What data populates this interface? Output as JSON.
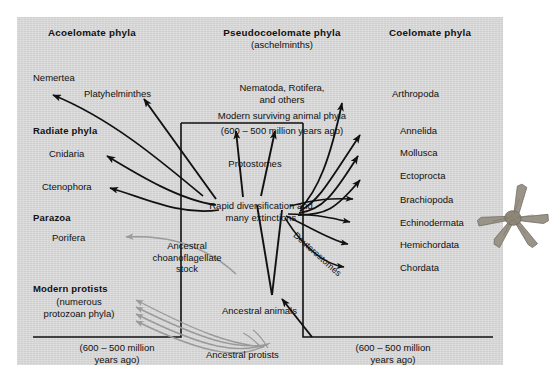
{
  "figure": {
    "panel_color": "#d6d6d6",
    "ink_color": "#111111",
    "faded_arrow_color": "#8f8f8f"
  },
  "headers": [
    {
      "id": "acoelomate",
      "label": "Acoelomate phyla",
      "sub": ""
    },
    {
      "id": "pseudocoelomate",
      "label": "Pseudocoelomate phyla",
      "sub": "(aschelminths)"
    },
    {
      "id": "coelomate",
      "label": "Coelomate phyla",
      "sub": ""
    }
  ],
  "left_groups": [
    {
      "id": "nemertea",
      "label": "Nemertea",
      "bold": false
    },
    {
      "id": "platyhelminthes",
      "label": "Platyhelminthes",
      "bold": false
    },
    {
      "id": "radiate-phyla",
      "label": "Radiate phyla",
      "bold": true
    },
    {
      "id": "cnidaria",
      "label": "Cnidaria",
      "bold": false
    },
    {
      "id": "ctenophora",
      "label": "Ctenophora",
      "bold": false
    },
    {
      "id": "parazoa",
      "label": "Parazoa",
      "bold": true
    },
    {
      "id": "porifera",
      "label": "Porifera",
      "bold": false
    },
    {
      "id": "modern-protists",
      "label": "Modern protists",
      "bold": true
    },
    {
      "id": "modern-protists-sub",
      "label": "(numerous\nprotozoan phyla)",
      "bold": false
    }
  ],
  "right_phyla": [
    {
      "id": "arthropoda",
      "label": "Arthropoda"
    },
    {
      "id": "annelida",
      "label": "Annelida"
    },
    {
      "id": "mollusca",
      "label": "Mollusca"
    },
    {
      "id": "ectoprocta",
      "label": "Ectoprocta"
    },
    {
      "id": "brachiopoda",
      "label": "Brachiopoda"
    },
    {
      "id": "echinodermata",
      "label": "Echinodermata"
    },
    {
      "id": "hemichordata",
      "label": "Hemichordata"
    },
    {
      "id": "chordata",
      "label": "Chordata"
    }
  ],
  "center": {
    "pseudocoelomate_phyla": "Nematoda, Rotifera,\nand others",
    "modern_surviving": "Modern surviving animal phyla",
    "modern_surviving_date": "(600 – 500 million years ago)",
    "protostomes": "Protostomes",
    "deuterostomes": "Deuterostomes",
    "rapid_diversification": "Rapid diversification and\nmany extinctions",
    "ancestral_choanoflagellate": "Ancestral\nchoanoflagellate\nstock",
    "ancestral_animals": "Ancestral animals",
    "ancestral_protists": "Ancestral protists"
  },
  "brackets": {
    "left_caption": "(600 – 500 million\nyears ago)",
    "right_caption": "(600 – 500 million\nyears ago)"
  },
  "decor": {
    "starfish": "starfish-illustration"
  }
}
